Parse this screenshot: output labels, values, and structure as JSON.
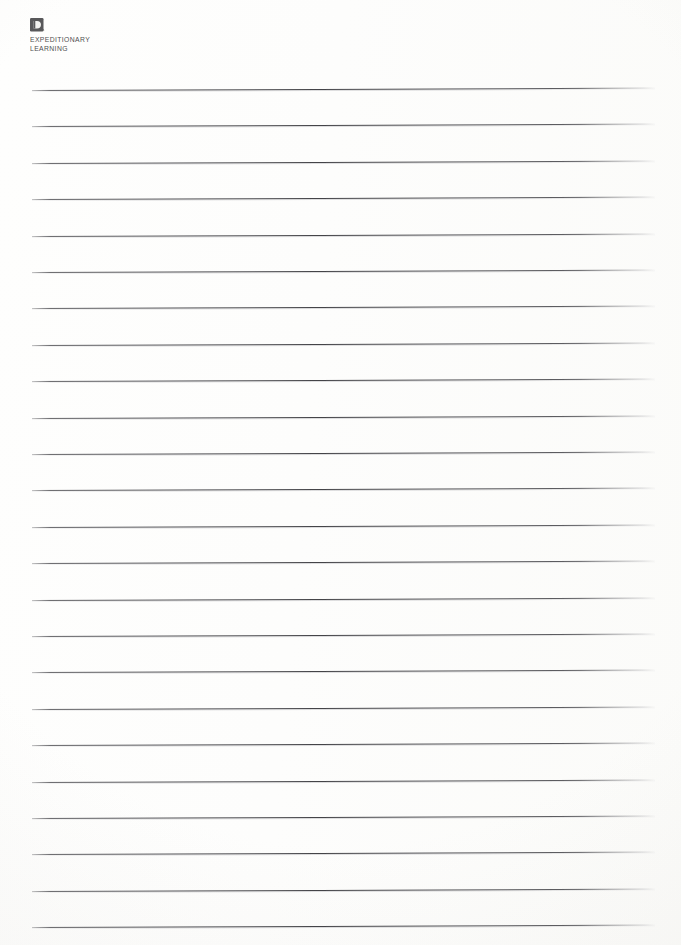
{
  "document": {
    "type": "lined-worksheet",
    "title": "Expeditionary Learning Lined Worksheet",
    "page_background": "#fdfdfc"
  },
  "logo": {
    "mark_name": "expeditionary-learning-badge-icon",
    "mark_color": "#58585a",
    "glyph_color": "#f2f2f0",
    "wordmark_line1": "EXPEDITIONARY",
    "wordmark_line2": "LEARNING",
    "text_color": "#4e4e50"
  },
  "ruled_lines": {
    "count": 24,
    "color": "#46464a",
    "left_x": 32,
    "right_x": 655,
    "first_y": 90,
    "spacing": 36.4,
    "skew_degrees": -0.22,
    "positions": [
      90.0,
      126.4,
      162.8,
      199.2,
      235.6,
      272.0,
      308.4,
      344.8,
      381.2,
      417.6,
      454.0,
      490.4,
      526.8,
      563.2,
      599.6,
      636.0,
      672.4,
      708.8,
      745.2,
      781.6,
      818.0,
      854.4,
      890.8,
      927.2
    ]
  }
}
